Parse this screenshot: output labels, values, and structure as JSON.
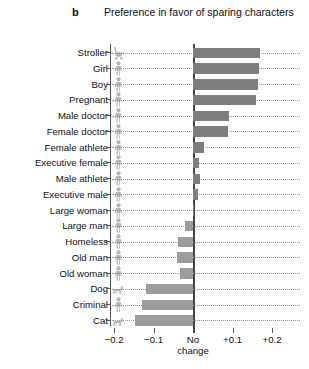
{
  "panel": {
    "letter": "b"
  },
  "chart_data": {
    "type": "bar",
    "orientation": "horizontal",
    "title": "Preference in favor of sparing characters",
    "xlabel": "",
    "ylabel": "",
    "xlim": [
      -0.25,
      0.25
    ],
    "xticks": [
      -0.2,
      -0.1,
      0,
      0.1,
      0.2
    ],
    "xticklabels": [
      "−0.2",
      "−0.1",
      "No change",
      "+0.1",
      "+0.2"
    ],
    "grid": "dotted-horizontal",
    "legend": "none",
    "zero_reference_label": "No change",
    "categories": [
      "Stroller",
      "Girl",
      "Boy",
      "Pregnant",
      "Male doctor",
      "Female doctor",
      "Female athlete",
      "Executive female",
      "Male athlete",
      "Executive male",
      "Large woman",
      "Large man",
      "Homeless",
      "Old man",
      "Old woman",
      "Dog",
      "Criminal",
      "Cat"
    ],
    "values": [
      0.17,
      0.166,
      0.164,
      0.16,
      0.09,
      0.089,
      0.028,
      0.016,
      0.018,
      0.012,
      0.002,
      -0.021,
      -0.038,
      -0.04,
      -0.034,
      -0.12,
      -0.128,
      -0.146
    ],
    "icons": [
      "stroller-icon",
      "girl-icon",
      "boy-icon",
      "pregnant-icon",
      "male-doctor-icon",
      "female-doctor-icon",
      "female-athlete-icon",
      "executive-female-icon",
      "male-athlete-icon",
      "executive-male-icon",
      "large-woman-icon",
      "large-man-icon",
      "homeless-icon",
      "old-man-icon",
      "old-woman-icon",
      "dog-icon",
      "criminal-icon",
      "cat-icon"
    ],
    "colors": {
      "bar_positive": "#7e7e7e",
      "bar_negative": "#9d9d9d",
      "axis": "#555555",
      "zero_line": "#444444",
      "gridline": "#9a9a9a"
    }
  }
}
